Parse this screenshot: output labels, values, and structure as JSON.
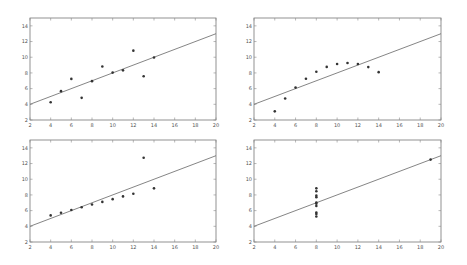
{
  "chart_data": [
    {
      "type": "scatter",
      "title": "",
      "xlabel": "",
      "ylabel": "",
      "xlim": [
        2,
        20
      ],
      "ylim": [
        2,
        15
      ],
      "xticks": [
        2,
        4,
        6,
        8,
        10,
        12,
        14,
        16,
        18,
        20
      ],
      "yticks": [
        2,
        4,
        6,
        8,
        10,
        12,
        14
      ],
      "grid": false,
      "x": [
        10,
        8,
        13,
        9,
        11,
        14,
        6,
        4,
        12,
        7,
        5
      ],
      "y": [
        8.04,
        6.95,
        7.58,
        8.81,
        8.33,
        9.96,
        7.24,
        4.26,
        10.84,
        4.82,
        5.68
      ],
      "fit_line": {
        "slope": 0.5,
        "intercept": 3.0
      }
    },
    {
      "type": "scatter",
      "title": "",
      "xlabel": "",
      "ylabel": "",
      "xlim": [
        2,
        20
      ],
      "ylim": [
        2,
        15
      ],
      "xticks": [
        2,
        4,
        6,
        8,
        10,
        12,
        14,
        16,
        18,
        20
      ],
      "yticks": [
        2,
        4,
        6,
        8,
        10,
        12,
        14
      ],
      "grid": false,
      "x": [
        10,
        8,
        13,
        9,
        11,
        14,
        6,
        4,
        12,
        7,
        5
      ],
      "y": [
        9.14,
        8.14,
        8.74,
        8.77,
        9.26,
        8.1,
        6.13,
        3.1,
        9.13,
        7.26,
        4.74
      ],
      "fit_line": {
        "slope": 0.5,
        "intercept": 3.0
      }
    },
    {
      "type": "scatter",
      "title": "",
      "xlabel": "",
      "ylabel": "",
      "xlim": [
        2,
        20
      ],
      "ylim": [
        2,
        15
      ],
      "xticks": [
        2,
        4,
        6,
        8,
        10,
        12,
        14,
        16,
        18,
        20
      ],
      "yticks": [
        2,
        4,
        6,
        8,
        10,
        12,
        14
      ],
      "grid": false,
      "x": [
        10,
        8,
        13,
        9,
        11,
        14,
        6,
        4,
        12,
        7,
        5
      ],
      "y": [
        7.46,
        6.77,
        12.74,
        7.11,
        7.81,
        8.84,
        6.08,
        5.39,
        8.15,
        6.42,
        5.73
      ],
      "fit_line": {
        "slope": 0.5,
        "intercept": 3.0
      }
    },
    {
      "type": "scatter",
      "title": "",
      "xlabel": "",
      "ylabel": "",
      "xlim": [
        2,
        20
      ],
      "ylim": [
        2,
        15
      ],
      "xticks": [
        2,
        4,
        6,
        8,
        10,
        12,
        14,
        16,
        18,
        20
      ],
      "yticks": [
        2,
        4,
        6,
        8,
        10,
        12,
        14
      ],
      "grid": false,
      "x": [
        8,
        8,
        8,
        8,
        8,
        8,
        8,
        19,
        8,
        8,
        8
      ],
      "y": [
        6.58,
        5.76,
        7.71,
        8.84,
        8.47,
        7.04,
        5.25,
        12.5,
        5.56,
        7.91,
        6.89
      ],
      "fit_line": {
        "slope": 0.5,
        "intercept": 3.0
      }
    }
  ],
  "layout": {
    "panels": [
      {
        "name": "panel-1",
        "left": 30,
        "top": 18,
        "right": 216,
        "bottom": 120
      },
      {
        "name": "panel-2",
        "left": 254,
        "top": 18,
        "right": 441,
        "bottom": 120
      },
      {
        "name": "panel-3",
        "left": 30,
        "top": 140,
        "right": 216,
        "bottom": 242
      },
      {
        "name": "panel-4",
        "left": 254,
        "top": 140,
        "right": 441,
        "bottom": 242
      }
    ]
  },
  "colors": {
    "point": "#333333",
    "line": "#666666",
    "frame": "#777777"
  }
}
